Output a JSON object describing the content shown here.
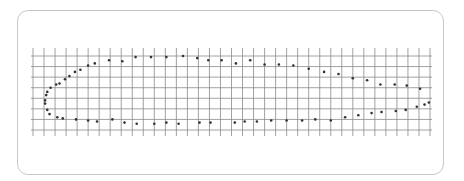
{
  "figure": {
    "grid": {
      "columns": 36,
      "rows": 8
    },
    "colors": {
      "grid": "#8a8a8a",
      "points": "#333333",
      "border": "#c8c8c8",
      "background": "#ffffff"
    }
  },
  "points": {
    "upper": [
      [
        1.3,
        4.6
      ],
      [
        1.6,
        5.0
      ],
      [
        2.1,
        5.3
      ],
      [
        2.4,
        5.4
      ],
      [
        2.9,
        5.8
      ],
      [
        3.3,
        6.1
      ],
      [
        3.8,
        6.5
      ],
      [
        4.3,
        6.7
      ],
      [
        5.0,
        7.1
      ],
      [
        5.6,
        7.3
      ],
      [
        6.9,
        7.6
      ],
      [
        8.1,
        7.5
      ],
      [
        9.3,
        7.9
      ],
      [
        10.7,
        7.9
      ],
      [
        12.1,
        7.9
      ],
      [
        13.6,
        8.0
      ],
      [
        14.9,
        7.8
      ],
      [
        15.9,
        7.6
      ],
      [
        17.1,
        7.6
      ],
      [
        18.4,
        7.3
      ],
      [
        19.7,
        7.6
      ],
      [
        21.0,
        7.2
      ],
      [
        22.3,
        7.2
      ],
      [
        23.6,
        7.1
      ],
      [
        25.0,
        6.8
      ],
      [
        26.4,
        6.5
      ],
      [
        27.7,
        6.3
      ],
      [
        29.0,
        5.9
      ],
      [
        30.3,
        5.7
      ],
      [
        31.5,
        5.3
      ],
      [
        32.8,
        5.3
      ],
      [
        33.9,
        5.2
      ],
      [
        35.1,
        4.9
      ]
    ],
    "lower": [
      [
        1.2,
        4.3
      ],
      [
        1.1,
        3.8
      ],
      [
        1.1,
        3.5
      ],
      [
        1.3,
        2.9
      ],
      [
        1.5,
        2.5
      ],
      [
        2.2,
        2.2
      ],
      [
        2.7,
        2.1
      ],
      [
        3.9,
        2.0
      ],
      [
        5.0,
        1.9
      ],
      [
        5.8,
        1.8
      ],
      [
        7.2,
        2.0
      ],
      [
        8.3,
        1.7
      ],
      [
        9.4,
        1.6
      ],
      [
        11.0,
        1.6
      ],
      [
        12.1,
        1.7
      ],
      [
        13.2,
        1.6
      ],
      [
        15.1,
        1.7
      ],
      [
        16.1,
        1.7
      ],
      [
        18.3,
        1.7
      ],
      [
        19.2,
        1.8
      ],
      [
        20.3,
        1.8
      ],
      [
        21.6,
        1.9
      ],
      [
        23.0,
        1.9
      ],
      [
        24.4,
        1.9
      ],
      [
        25.6,
        2.0
      ],
      [
        27.0,
        1.9
      ],
      [
        28.3,
        2.2
      ],
      [
        29.5,
        2.4
      ],
      [
        30.7,
        2.6
      ],
      [
        31.6,
        2.7
      ],
      [
        32.9,
        2.8
      ],
      [
        33.8,
        2.9
      ],
      [
        34.8,
        3.2
      ],
      [
        35.5,
        3.4
      ],
      [
        35.9,
        3.6
      ]
    ]
  }
}
